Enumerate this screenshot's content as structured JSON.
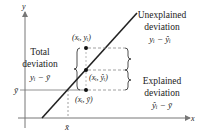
{
  "diagram": {
    "axes": {
      "x_label": "x",
      "y_label": "y"
    },
    "mean_labels": {
      "y_bar": "ȳ",
      "x_bar": "x̄"
    },
    "points": {
      "observed": "(xᵢ, yᵢ)",
      "predicted": "(xᵢ, ŷᵢ)",
      "mean": "(xᵢ, ȳ)"
    },
    "annotations": {
      "total": {
        "line1": "Total",
        "line2": "deviation",
        "formula": "yᵢ − ȳ"
      },
      "unexplained": {
        "line1": "Unexplained",
        "line2": "deviation",
        "formula": "yᵢ − ŷᵢ"
      },
      "explained": {
        "line1": "Explained",
        "line2": "deviation",
        "formula": "ŷᵢ − ȳ"
      }
    },
    "colors": {
      "ink": "#222222",
      "axis": "#777777",
      "dashed": "#888888"
    }
  }
}
